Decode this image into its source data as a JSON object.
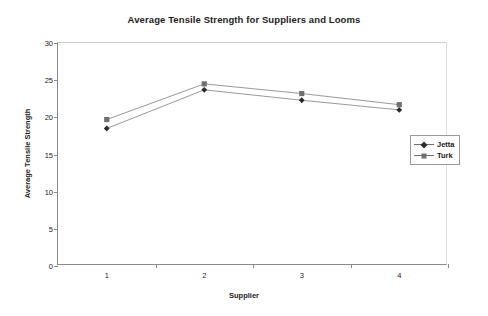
{
  "chart_data": {
    "type": "line",
    "title": "Average Tensile Strength for Suppliers and Looms",
    "xlabel": "Supplier",
    "ylabel": "Average Tensile Strength",
    "categories": [
      "1",
      "2",
      "3",
      "4"
    ],
    "yticks": [
      "0",
      "5",
      "10",
      "15",
      "20",
      "25",
      "30"
    ],
    "ylim": [
      0,
      30
    ],
    "grid": false,
    "legend_position": "right",
    "series": [
      {
        "name": "Jetta",
        "marker": "diamond",
        "color": "#2b2b2b",
        "values": [
          18.5,
          23.7,
          22.3,
          21.0
        ]
      },
      {
        "name": "Turk",
        "marker": "square",
        "color": "#707070",
        "values": [
          19.7,
          24.5,
          23.2,
          21.7
        ]
      }
    ]
  },
  "legend": {
    "items": [
      {
        "label": "Jetta",
        "marker_icon": "diamond-marker-icon"
      },
      {
        "label": "Turk",
        "marker_icon": "square-marker-icon"
      }
    ]
  }
}
